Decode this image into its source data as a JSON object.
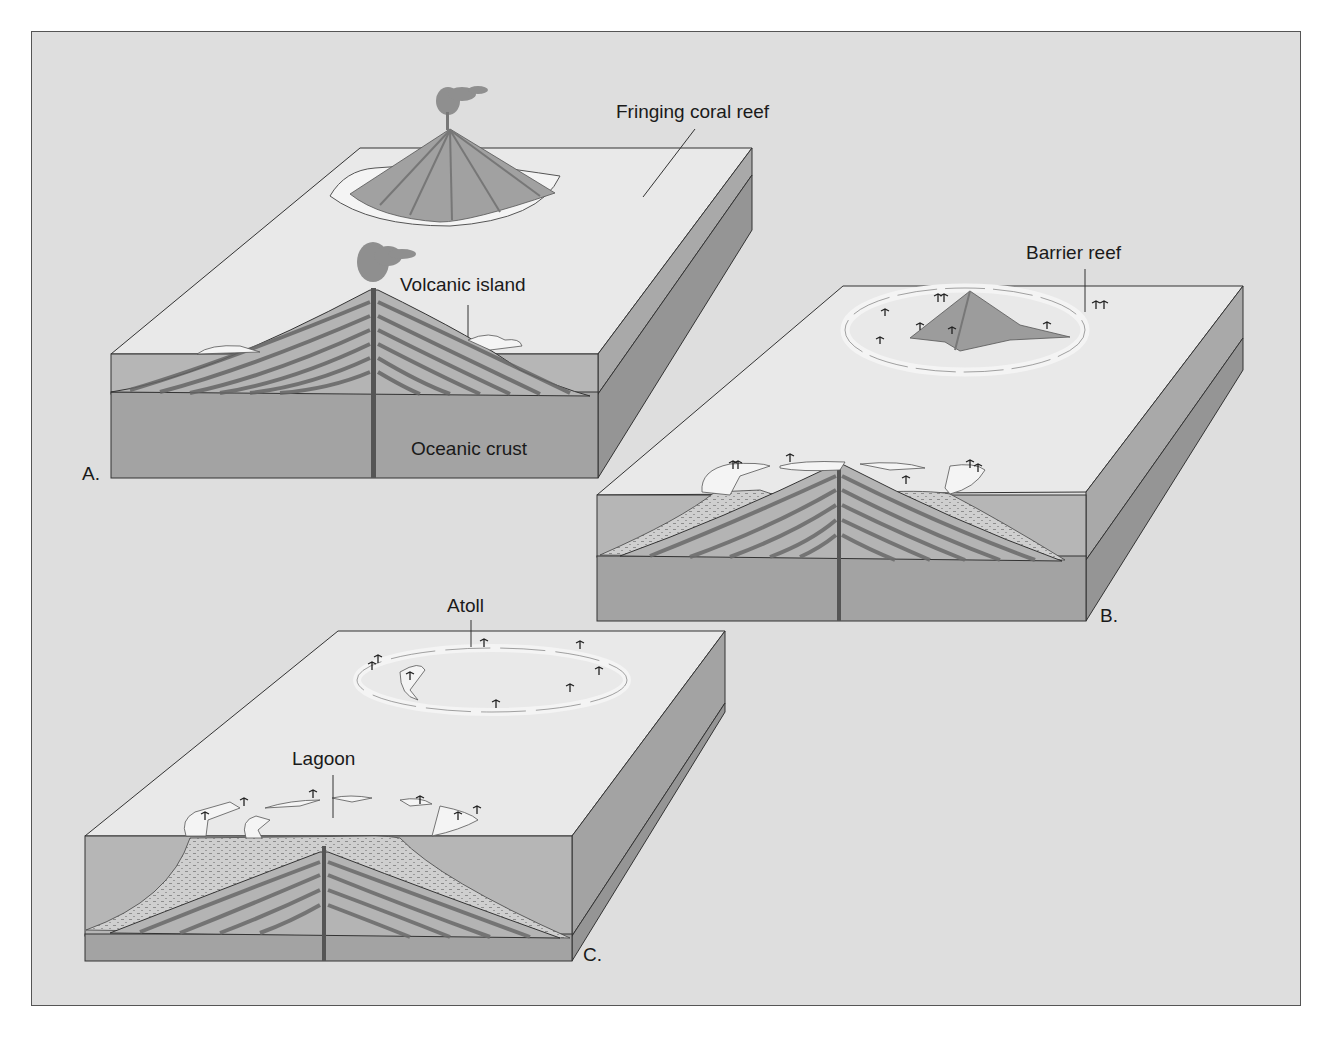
{
  "figure": {
    "panels": [
      {
        "id": "A",
        "letter": "A.",
        "labels": {
          "fringing_reef": "Fringing coral reef",
          "volcanic_island": "Volcanic island",
          "oceanic_crust": "Oceanic crust"
        }
      },
      {
        "id": "B",
        "letter": "B.",
        "labels": {
          "barrier_reef": "Barrier reef"
        }
      },
      {
        "id": "C",
        "letter": "C.",
        "labels": {
          "atoll": "Atoll",
          "lagoon": "Lagoon"
        }
      }
    ]
  },
  "colors": {
    "background": "#dedede",
    "sea_surface": "#e9e9e9",
    "water_layer": "#b6b6b6",
    "crust": "#a3a3a3",
    "side_light": "#a8a8a8",
    "side_dark": "#969696",
    "volcano": "#9b9b9b",
    "reef": "#f4f4f4",
    "outline": "#333333"
  }
}
